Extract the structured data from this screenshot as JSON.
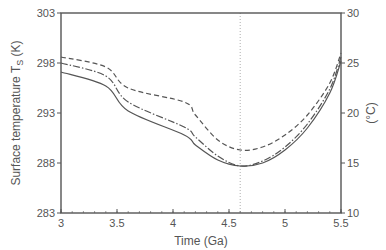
{
  "chart_data": {
    "type": "line",
    "title": "",
    "xlabel": "Time (Ga)",
    "ylabel": "Surface temperature T_s (K)",
    "ylabel_main": "Surface temperature T",
    "ylabel_sub": "S",
    "ylabel_unit": " (K)",
    "y2label": "(°C)",
    "xlim": [
      3,
      5.5
    ],
    "ylim": [
      283,
      303
    ],
    "y2lim": [
      10,
      30
    ],
    "xticks": [
      3,
      3.5,
      4,
      4.5,
      5,
      5.5
    ],
    "xtick_labels": [
      "3",
      "3.5",
      "4",
      "4.5",
      "5",
      "5.5"
    ],
    "yticks": [
      283,
      288,
      293,
      298,
      303
    ],
    "ytick_labels": [
      "283",
      "288",
      "293",
      "298",
      "303"
    ],
    "y2ticks": [
      10,
      15,
      20,
      25,
      30
    ],
    "y2tick_labels": [
      "10",
      "15",
      "20",
      "25",
      "30"
    ],
    "grid": false,
    "legend": null,
    "vertical_marker": {
      "x": 4.6,
      "style": "dotted"
    },
    "x": [
      3.0,
      3.4,
      3.6,
      4.1,
      4.2,
      4.4,
      4.6,
      4.8,
      5.0,
      5.2,
      5.4,
      5.5
    ],
    "series": [
      {
        "name": "dashed",
        "style": "dashed",
        "values": [
          298.6,
          297.6,
          295.5,
          294.1,
          292.8,
          290.3,
          289.3,
          289.6,
          290.8,
          292.8,
          296.0,
          299.0
        ]
      },
      {
        "name": "dash-dot",
        "style": "dashdot",
        "values": [
          298.0,
          296.7,
          294.1,
          291.6,
          290.6,
          288.7,
          287.7,
          288.2,
          289.6,
          291.9,
          295.4,
          298.6
        ]
      },
      {
        "name": "solid",
        "style": "solid",
        "values": [
          297.1,
          295.7,
          293.2,
          290.8,
          289.8,
          288.3,
          287.7,
          288.0,
          289.3,
          291.5,
          295.0,
          298.2
        ]
      }
    ]
  },
  "colors": {
    "axis": "#555555",
    "line": "#555555",
    "marker": "#999999"
  }
}
